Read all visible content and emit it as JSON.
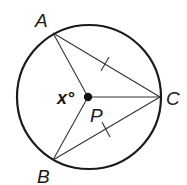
{
  "diagram": {
    "circle": {
      "center": "P",
      "cx": 89,
      "cy": 97,
      "r": 72
    },
    "points": {
      "A": {
        "label": "A",
        "x": 53,
        "y": 33
      },
      "B": {
        "label": "B",
        "x": 53,
        "y": 160
      },
      "C": {
        "label": "C",
        "x": 160,
        "y": 97
      },
      "P": {
        "label": "P",
        "x": 88,
        "y": 97
      }
    },
    "segments": [
      {
        "from": "A",
        "to": "C",
        "tick": true
      },
      {
        "from": "B",
        "to": "C",
        "tick": true
      },
      {
        "from": "P",
        "to": "A",
        "tick": false
      },
      {
        "from": "P",
        "to": "B",
        "tick": false
      },
      {
        "from": "P",
        "to": "C",
        "tick": false
      }
    ],
    "angle_label": "x°",
    "colors": {
      "stroke": "#1a1a1a",
      "background": "#ffffff"
    }
  }
}
